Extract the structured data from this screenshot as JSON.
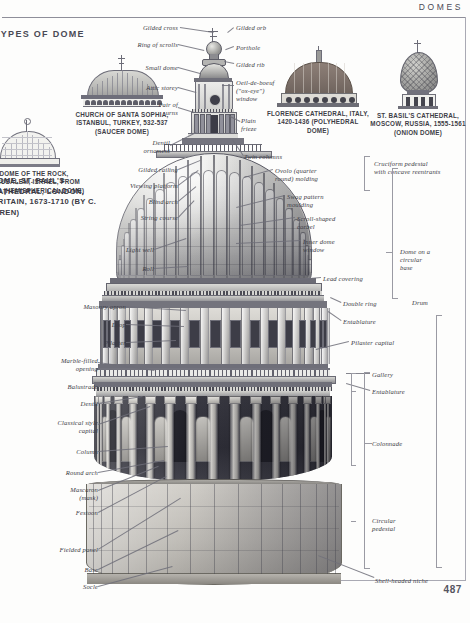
{
  "header": {
    "title": "DOMES",
    "page_number": "487"
  },
  "section": {
    "types_title": "TYPES OF DOME",
    "main_caption": "DOME, ST. PAUL'S CATHEDRAL, LONDON, BRITAIN, 1673-1710 (BY C. WREN)"
  },
  "thumbnails": [
    {
      "name": "dome-of-the-rock",
      "caption": "DOME OF THE ROCK, JERUSALEM, ISRAEL, FROM C.684 (HEMISPHERICAL DOME)"
    },
    {
      "name": "santa-sophia",
      "caption": "CHURCH OF SANTA SOPHIA, ISTANBUL, TURKEY, 532-537 (SAUCER DOME)"
    },
    {
      "name": "florence-cathedral",
      "caption": "FLORENCE CATHEDRAL, ITALY, 1420-1436 (POLYHEDRAL DOME)"
    },
    {
      "name": "st-basils-cathedral",
      "caption": "ST. BASIL'S CATHEDRAL, MOSCOW, RUSSIA, 1555-1561 (ONION DOME)"
    }
  ],
  "labels_left": [
    {
      "id": "gilded-railing",
      "text": "Gilded railing"
    },
    {
      "id": "viewing-platform",
      "text": "Viewing platform"
    },
    {
      "id": "blind-arch",
      "text": "Blind arch"
    },
    {
      "id": "string-course",
      "text": "String course"
    },
    {
      "id": "light-well",
      "text": "Light well"
    },
    {
      "id": "roll",
      "text": "Roll"
    },
    {
      "id": "masonry-apron",
      "text": "Masonry apron"
    },
    {
      "id": "drop",
      "text": "Drop"
    },
    {
      "id": "pilaster",
      "text": "Pilaster"
    },
    {
      "id": "marble-filled-opening",
      "text": "Marble-filled\nopening"
    },
    {
      "id": "balustrade",
      "text": "Balustrade"
    },
    {
      "id": "dentil",
      "text": "Dentil"
    },
    {
      "id": "classical-style-capital",
      "text": "Classical style\ncapital"
    },
    {
      "id": "column",
      "text": "Column"
    },
    {
      "id": "round-arch",
      "text": "Round arch"
    },
    {
      "id": "mascaron",
      "text": "Mascaron\n(mask)"
    },
    {
      "id": "festoon",
      "text": "Festoon"
    },
    {
      "id": "fielded-panel",
      "text": "Fielded panel"
    },
    {
      "id": "base",
      "text": "Base"
    },
    {
      "id": "socle",
      "text": "Socle"
    }
  ],
  "labels_top": [
    {
      "id": "gilded-cross",
      "text": "Gilded cross"
    },
    {
      "id": "ring-of-scrolls",
      "text": "Ring of  scrolls"
    },
    {
      "id": "small-dome",
      "text": "Small dome"
    },
    {
      "id": "attic-storey",
      "text": "Attic storey"
    },
    {
      "id": "pair-of-urns",
      "text": "Pair of\nurns"
    },
    {
      "id": "dentil-ornament",
      "text": "Dentil\nornament"
    },
    {
      "id": "gilded-orb",
      "text": "Gilded orb"
    },
    {
      "id": "porthole",
      "text": "Porthole"
    },
    {
      "id": "gilded-rib",
      "text": "Gilded rib"
    },
    {
      "id": "oeil-de-boeuf-window",
      "text": "Oeil-de-boeuf\n(\"ox-eye\")\nwindow"
    },
    {
      "id": "plain-frieze",
      "text": "Plain\nfrieze"
    },
    {
      "id": "twin-columns",
      "text": "Twin columns"
    }
  ],
  "labels_right": [
    {
      "id": "ovolo-molding",
      "text": "Ovolo (quarter\nround) molding"
    },
    {
      "id": "swag-pattern-moulding",
      "text": "Swag pattern\nmoulding"
    },
    {
      "id": "scroll-shaped-corbel",
      "text": "Scroll-shaped\ncorbel"
    },
    {
      "id": "inner-dome-window",
      "text": "Inner dome\nwindow"
    },
    {
      "id": "lead-covering",
      "text": "Lead covering"
    },
    {
      "id": "double-ring",
      "text": "Double ring"
    },
    {
      "id": "entablature-upper",
      "text": "Entablature"
    },
    {
      "id": "pilaster-capital",
      "text": "Pilaster capital"
    },
    {
      "id": "gallery",
      "text": "Gallery"
    },
    {
      "id": "entablature-lower",
      "text": "Entablature"
    },
    {
      "id": "shell-headed-niche",
      "text": "Shell-headed niche"
    }
  ],
  "brackets": [
    {
      "id": "cruciform-pedestal",
      "text": "Cruciform pedestal\nwith concave reentrants"
    },
    {
      "id": "dome-on-circular-base",
      "text": "Dome on a\ncircular\nbase"
    },
    {
      "id": "drum",
      "text": "Drum"
    },
    {
      "id": "colonnade",
      "text": "Colonnade"
    },
    {
      "id": "circular-pedestal",
      "text": "Circular\npedestal"
    }
  ],
  "colors": {
    "ink": "#33333a",
    "rule": "#8e8e99",
    "leader": "#6f6f79",
    "page_bg": "#fdfdfc"
  }
}
